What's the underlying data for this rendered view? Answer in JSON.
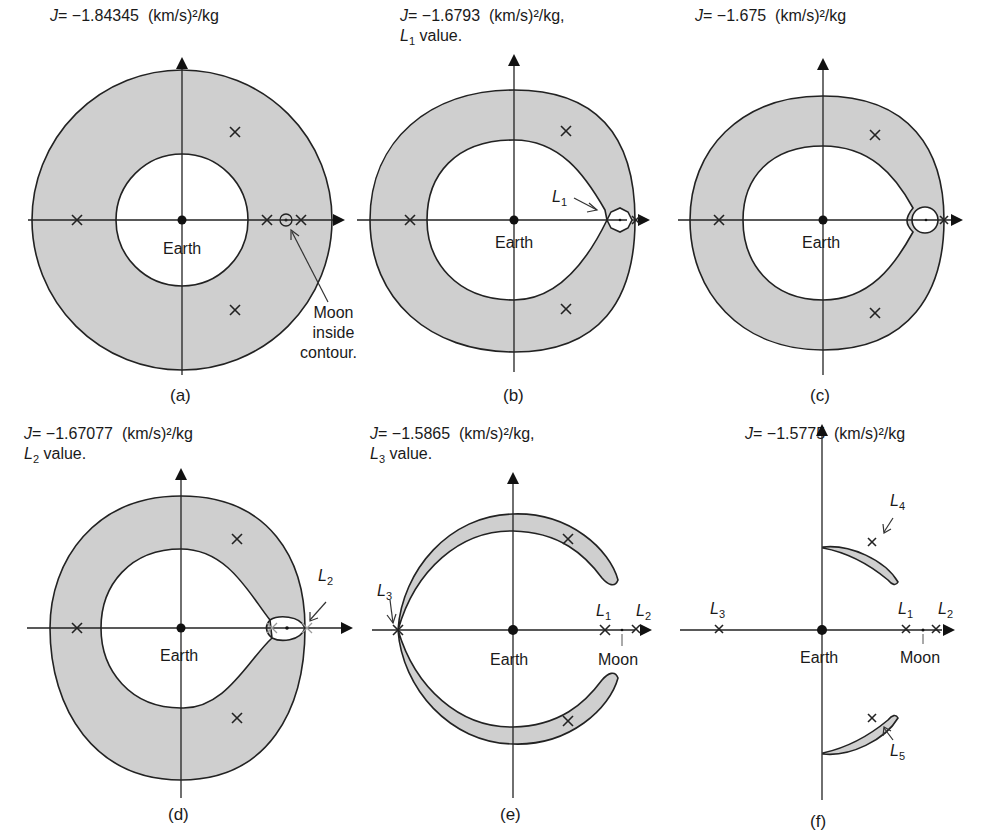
{
  "figure": {
    "units": "(km/s)²/kg",
    "body_labels": {
      "earth": "Earth",
      "moon": "Moon"
    },
    "panels": [
      {
        "id": "a",
        "caption": "(a)",
        "j_value": "−1.84345",
        "title_suffix": "",
        "title_line2": "",
        "annotation": "Moon inside contour.",
        "annotation_lines": [
          "Moon",
          "inside",
          "contour."
        ]
      },
      {
        "id": "b",
        "caption": "(b)",
        "j_value": "−1.6793",
        "title_suffix": ",",
        "title_line2_point": "L",
        "title_line2_sub": "1",
        "title_line2": "value.",
        "point_label": "L",
        "point_sub": "1"
      },
      {
        "id": "c",
        "caption": "(c)",
        "j_value": "−1.675",
        "title_suffix": ""
      },
      {
        "id": "d",
        "caption": "(d)",
        "j_value": "−1.67077",
        "title_suffix": "",
        "title_line2_point": "L",
        "title_line2_sub": "2",
        "title_line2": "value.",
        "point_label": "L",
        "point_sub": "2"
      },
      {
        "id": "e",
        "caption": "(e)",
        "j_value": "−1.5865",
        "title_suffix": ",",
        "title_line2_point": "L",
        "title_line2_sub": "3",
        "title_line2": "value.",
        "labels": [
          {
            "t": "L",
            "s": "3"
          },
          {
            "t": "L",
            "s": "1"
          },
          {
            "t": "L",
            "s": "2"
          }
        ]
      },
      {
        "id": "f",
        "caption": "(f)",
        "j_value": "−1.5775",
        "title_suffix": "",
        "labels": [
          {
            "t": "L",
            "s": "3"
          },
          {
            "t": "L",
            "s": "1"
          },
          {
            "t": "L",
            "s": "2"
          },
          {
            "t": "L",
            "s": "4"
          },
          {
            "t": "L",
            "s": "5"
          }
        ]
      }
    ],
    "j_symbol": "J",
    "equals": "="
  }
}
